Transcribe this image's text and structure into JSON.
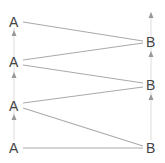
{
  "diagram": {
    "nodes_a": [
      {
        "label": "A",
        "x": 14,
        "y": 22
      },
      {
        "label": "A",
        "x": 14,
        "y": 62
      },
      {
        "label": "A",
        "x": 14,
        "y": 106
      },
      {
        "label": "A",
        "x": 14,
        "y": 148
      }
    ],
    "nodes_b": [
      {
        "label": "B",
        "x": 151,
        "y": 42
      },
      {
        "label": "B",
        "x": 151,
        "y": 85
      },
      {
        "label": "B",
        "x": 151,
        "y": 148
      }
    ],
    "colors": {
      "edge": "#aaaaaa",
      "axis": "#dddddd",
      "arrow": "#999999",
      "label": "#444444"
    }
  }
}
